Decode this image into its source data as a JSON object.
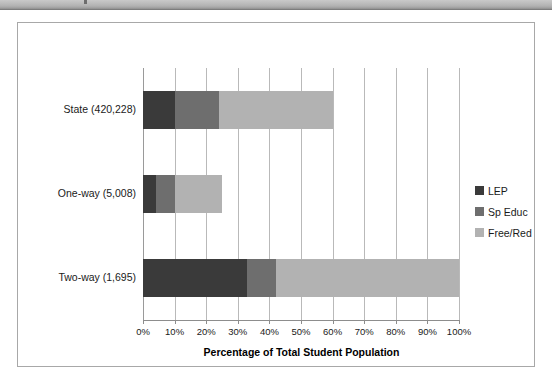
{
  "figure": {
    "scan_band_present": true
  },
  "chart_data": {
    "type": "bar",
    "orientation": "horizontal",
    "stacked": true,
    "title": "",
    "xlabel": "Percentage of Total Student Population",
    "ylabel": "",
    "categories": [
      "State (420,228)",
      "One-way (5,008)",
      "Two-way (1,695)"
    ],
    "series": [
      {
        "name": "LEP",
        "color": "#3a3a3a",
        "values": [
          10,
          4,
          33
        ]
      },
      {
        "name": "Sp Educ",
        "color": "#6e6e6e",
        "values": [
          14,
          6,
          9
        ]
      },
      {
        "name": "Free/Red",
        "color": "#b2b2b2",
        "values": [
          36,
          15,
          58
        ]
      }
    ],
    "totals": [
      60,
      25,
      100
    ],
    "xlim": [
      0,
      100
    ],
    "xticks": [
      0,
      10,
      20,
      30,
      40,
      50,
      60,
      70,
      80,
      90,
      100
    ],
    "xtick_labels": [
      "0%",
      "10%",
      "20%",
      "30%",
      "40%",
      "50%",
      "60%",
      "70%",
      "80%",
      "90%",
      "100%"
    ],
    "grid": true,
    "grid_axis": "x",
    "legend_position": "right",
    "legend_entries": [
      "LEP",
      "Sp Educ",
      "Free/Red"
    ]
  }
}
